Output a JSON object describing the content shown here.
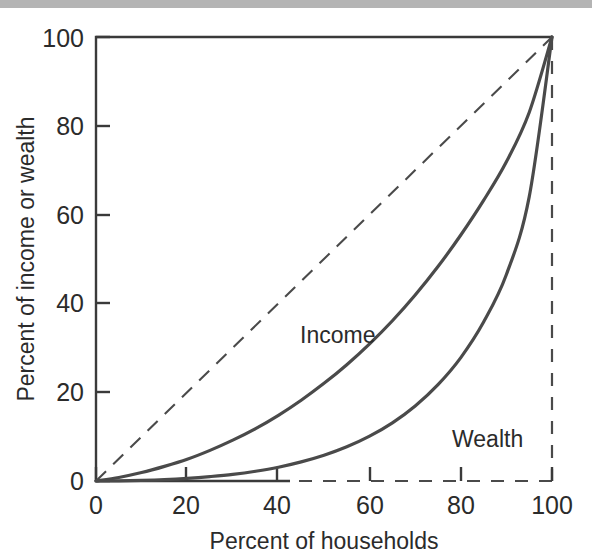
{
  "figure": {
    "background_color": "#ffffff",
    "band_color": "#b4b4b4",
    "axis_color": "#3a3a3a",
    "curve_color": "#4a4a4a",
    "dashed_color": "#4a4a4a"
  },
  "chart_data": {
    "type": "line",
    "title": "",
    "subtitle": "",
    "xlabel": "Percent of households",
    "ylabel": "Percent of income or wealth",
    "xlim": [
      0,
      100
    ],
    "ylim": [
      0,
      100
    ],
    "xticks": [
      0,
      20,
      40,
      60,
      80,
      100
    ],
    "yticks": [
      0,
      20,
      40,
      60,
      80,
      100
    ],
    "xticklabels": [
      "0",
      "20",
      "40",
      "60",
      "80",
      "100"
    ],
    "yticklabels": [
      "0",
      "20",
      "40",
      "60",
      "80",
      "100"
    ],
    "grid": false,
    "legend_position": "inline-annotation",
    "annotations": [
      {
        "text": "Income",
        "x": 48,
        "y": 37
      },
      {
        "text": "Wealth",
        "x": 83,
        "y": 14
      }
    ],
    "series": [
      {
        "name": "Line of equality",
        "style": "dashed",
        "x": [
          0,
          100
        ],
        "values": [
          0,
          100
        ]
      },
      {
        "name": "Income",
        "style": "solid",
        "x": [
          0,
          5,
          10,
          15,
          20,
          25,
          30,
          35,
          40,
          45,
          50,
          55,
          60,
          65,
          70,
          75,
          80,
          85,
          90,
          95,
          100
        ],
        "values": [
          0,
          0.8,
          1.9,
          3.3,
          4.9,
          6.9,
          9.2,
          11.8,
          14.8,
          18.2,
          22.0,
          26.2,
          30.9,
          36.1,
          41.9,
          48.3,
          55.4,
          63.2,
          71.9,
          83.0,
          100.0
        ]
      },
      {
        "name": "Wealth",
        "style": "solid",
        "x": [
          0,
          5,
          10,
          15,
          20,
          25,
          30,
          35,
          40,
          45,
          50,
          55,
          60,
          65,
          70,
          75,
          80,
          85,
          90,
          95,
          100
        ],
        "values": [
          0,
          0.05,
          0.15,
          0.32,
          0.6,
          1.0,
          1.5,
          2.2,
          3.1,
          4.3,
          5.8,
          7.7,
          10.1,
          13.1,
          16.9,
          21.7,
          27.8,
          35.8,
          46.5,
          64.0,
          100.0
        ]
      }
    ]
  }
}
